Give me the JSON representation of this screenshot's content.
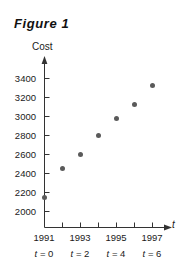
{
  "figure": {
    "title": "Figure 1",
    "marker_color": "#5a5a5a",
    "axis_color": "#333333"
  },
  "chart_data": {
    "type": "scatter",
    "title": "Figure 1",
    "xlabel": "t",
    "ylabel": "Cost",
    "grid": false,
    "legend": null,
    "xlim": [
      0,
      7
    ],
    "ylim": [
      1900,
      3500
    ],
    "x_tick_values": [
      0,
      1,
      2,
      3,
      4,
      5,
      6
    ],
    "x_tick_labels": [
      "1991",
      "",
      "1993",
      "",
      "1995",
      "",
      "1997"
    ],
    "x_sub_tick_labels": [
      "t = 0",
      "",
      "t = 2",
      "",
      "t = 4",
      "",
      "t = 6"
    ],
    "y_tick_values": [
      2000,
      2200,
      2400,
      2600,
      2800,
      3000,
      3200,
      3400
    ],
    "y_tick_labels": [
      "2000",
      "2200",
      "2400",
      "2600",
      "2800",
      "3000",
      "3200",
      "3400"
    ],
    "x": [
      0,
      1,
      2,
      3,
      4,
      5,
      6
    ],
    "values": [
      2150,
      2450,
      2600,
      2800,
      2975,
      3125,
      3330
    ],
    "points": [
      {
        "t": 0,
        "year": "1991",
        "cost": 2150
      },
      {
        "t": 1,
        "year": "1992",
        "cost": 2450
      },
      {
        "t": 2,
        "year": "1993",
        "cost": 2600
      },
      {
        "t": 3,
        "year": "1994",
        "cost": 2800
      },
      {
        "t": 4,
        "year": "1995",
        "cost": 2975
      },
      {
        "t": 5,
        "year": "1996",
        "cost": 3125
      },
      {
        "t": 6,
        "year": "1997",
        "cost": 3330
      }
    ]
  },
  "axis_labels": {
    "y_axis_caption": "Cost",
    "x_axis_caption": "t"
  },
  "y_ticks": [
    {
      "label": "3400"
    },
    {
      "label": "3200"
    },
    {
      "label": "3000"
    },
    {
      "label": "2800"
    },
    {
      "label": "2600"
    },
    {
      "label": "2400"
    },
    {
      "label": "2200"
    },
    {
      "label": "2000"
    }
  ],
  "x_ticks": [
    {
      "year": "1991",
      "t_var": "t",
      "t_eq": "= 0"
    },
    {
      "year": "1993",
      "t_var": "t",
      "t_eq": "= 2"
    },
    {
      "year": "1995",
      "t_var": "t",
      "t_eq": "= 4"
    },
    {
      "year": "1997",
      "t_var": "t",
      "t_eq": "= 6"
    }
  ]
}
